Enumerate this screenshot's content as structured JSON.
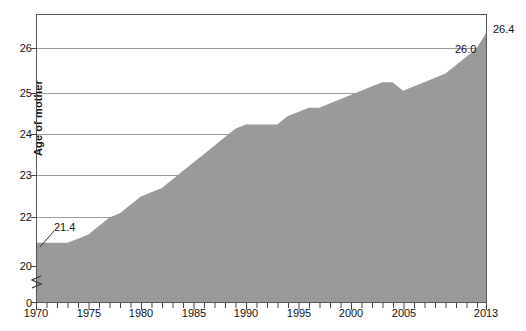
{
  "chart_data": {
    "type": "area",
    "title": "",
    "xlabel": "",
    "ylabel": "Age of mother",
    "xlim": [
      1970,
      2013
    ],
    "ylim": [
      0,
      26.9
    ],
    "y_axis_break": true,
    "y_break_between": [
      0,
      20
    ],
    "grid": true,
    "grid_axis": "y",
    "legend": "none",
    "area_color": "#9a9a9a",
    "axis_color": "#4a4a4a",
    "grid_color": "#9a9a9a",
    "y_ticks": [
      0,
      20,
      22,
      23,
      24,
      25,
      26
    ],
    "y_tick_labels": [
      "0",
      "20",
      "22",
      "23",
      "24",
      "25",
      "26"
    ],
    "x_ticks": [
      1970,
      1975,
      1980,
      1985,
      1990,
      1995,
      2000,
      2005,
      2013
    ],
    "x_tick_labels": [
      "1970",
      "1975",
      "1980",
      "1985",
      "1990",
      "1995",
      "2000",
      "2005",
      "2013"
    ],
    "x_minor_tick_step": 1,
    "annotations": [
      {
        "name": "first-value",
        "text": "21.4",
        "x": 1970,
        "y": 21.4,
        "leader": true
      },
      {
        "name": "2011-value",
        "text": "26.0",
        "x": 2011,
        "y": 26.0,
        "leader": false
      },
      {
        "name": "last-value",
        "text": "26.4",
        "x": 2013,
        "y": 26.4,
        "leader": false
      }
    ],
    "x": [
      1970,
      1971,
      1972,
      1973,
      1974,
      1975,
      1976,
      1977,
      1978,
      1979,
      1980,
      1981,
      1982,
      1983,
      1984,
      1985,
      1986,
      1987,
      1988,
      1989,
      1990,
      1991,
      1992,
      1993,
      1994,
      1995,
      1996,
      1997,
      1998,
      1999,
      2000,
      2001,
      2002,
      2003,
      2004,
      2005,
      2006,
      2007,
      2008,
      2009,
      2010,
      2011,
      2012,
      2013
    ],
    "values": [
      21.4,
      21.4,
      21.4,
      21.4,
      21.5,
      21.6,
      21.8,
      22.0,
      22.1,
      22.3,
      22.5,
      22.6,
      22.7,
      22.9,
      23.1,
      23.3,
      23.5,
      23.7,
      23.9,
      24.1,
      24.2,
      24.2,
      24.2,
      24.2,
      24.4,
      24.5,
      24.6,
      24.6,
      24.7,
      24.8,
      24.9,
      25.0,
      25.1,
      25.2,
      25.2,
      25.0,
      25.1,
      25.2,
      25.3,
      25.4,
      25.6,
      25.8,
      26.0,
      26.4
    ]
  }
}
